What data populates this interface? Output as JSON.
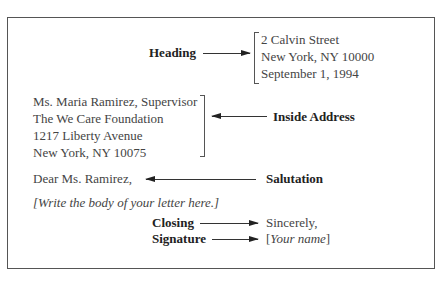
{
  "labels": {
    "heading": "Heading",
    "inside_address": "Inside Address",
    "salutation": "Salutation",
    "closing": "Closing",
    "signature": "Signature"
  },
  "heading_block": {
    "lines": [
      "2 Calvin Street",
      "New York, NY 10000",
      "September 1, 1994"
    ]
  },
  "inside_address_block": {
    "lines": [
      "Ms. Maria Ramirez, Supervisor",
      "The We Care Foundation",
      "1217 Liberty Avenue",
      "New York, NY 10075"
    ]
  },
  "salutation_text": "Dear Ms. Ramirez,",
  "body_placeholder": "[Write the body of your letter here.]",
  "closing_text": "Sincerely,",
  "signature_text": {
    "open": "[",
    "name": "Your name",
    "close": "]"
  }
}
